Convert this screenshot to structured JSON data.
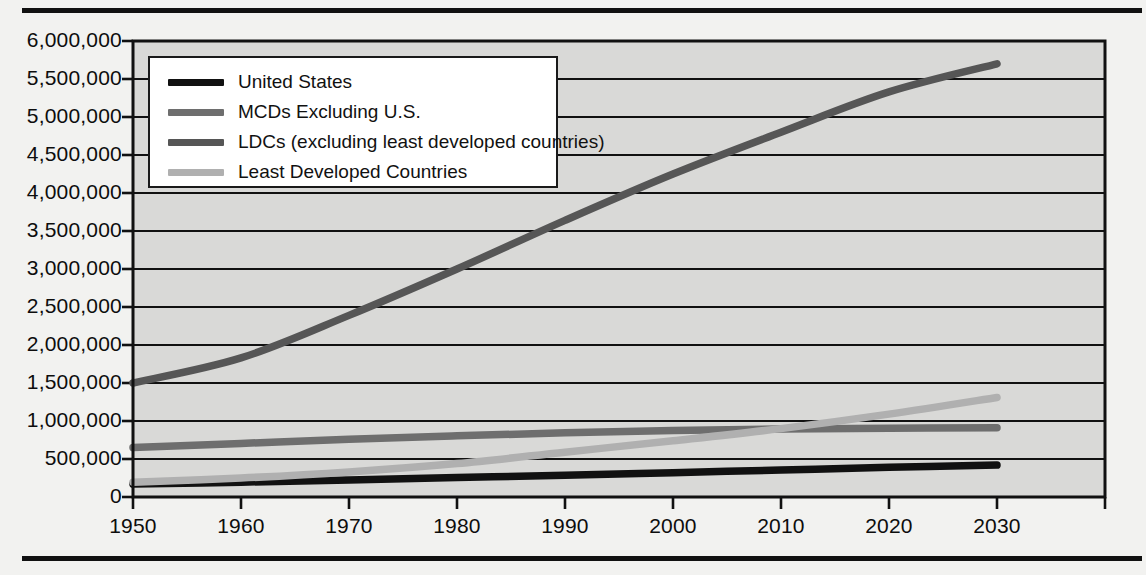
{
  "chart_data": {
    "type": "line",
    "title": "",
    "subtitle": "",
    "xlabel": "",
    "ylabel": "",
    "xlim": [
      1950,
      2040
    ],
    "ylim": [
      0,
      6000000
    ],
    "grid": true,
    "legend_position": "top-left inside plot",
    "x": [
      1950,
      1960,
      1970,
      1980,
      1990,
      2000,
      2010,
      2020,
      2030
    ],
    "x_tick_labels": [
      "1950",
      "1960",
      "1970",
      "1980",
      "1990",
      "2000",
      "2010",
      "2020",
      "2030"
    ],
    "y_tick_labels": [
      "6,000,000",
      "5,500,000",
      "5,000,000",
      "4,500,000",
      "4,000,000",
      "3,500,000",
      "3,000,000",
      "2,500,000",
      "2,000,000",
      "1,500,000",
      "1,000,000",
      "500,000",
      "0"
    ],
    "y_tick_values": [
      6000000,
      5500000,
      5000000,
      4500000,
      4000000,
      3500000,
      3000000,
      2500000,
      2000000,
      1500000,
      1000000,
      500000,
      0
    ],
    "y_tick_step": 500000,
    "series": [
      {
        "name": "United States",
        "color": "#111111",
        "values": [
          170000,
          195000,
          225000,
          255000,
          285000,
          320000,
          355000,
          390000,
          420000
        ]
      },
      {
        "name": "MCDs Excluding U.S.",
        "color": "#6e6e6e",
        "values": [
          650000,
          705000,
          760000,
          805000,
          845000,
          875000,
          895000,
          905000,
          910000
        ]
      },
      {
        "name": "LDCs (excluding least developed countries)",
        "color": "#565656",
        "values": [
          1500000,
          1830000,
          2390000,
          3000000,
          3640000,
          4250000,
          4800000,
          5330000,
          5700000
        ]
      },
      {
        "name": "Least Developed Countries",
        "color": "#b0b0b0",
        "values": [
          195000,
          250000,
          330000,
          440000,
          590000,
          740000,
          900000,
          1090000,
          1310000
        ]
      }
    ]
  },
  "legend": {
    "items": [
      {
        "label": "United States",
        "color": "#111111"
      },
      {
        "label": "MCDs Excluding U.S.",
        "color": "#6e6e6e"
      },
      {
        "label": "LDCs (excluding least developed countries)",
        "color": "#565656"
      },
      {
        "label": "Least Developed Countries",
        "color": "#b0b0b0"
      }
    ]
  },
  "style": {
    "plot_background": "#d9d9d7",
    "page_background": "#f2f2f0",
    "axis_color": "#111111",
    "gridline_color": "#111111"
  }
}
